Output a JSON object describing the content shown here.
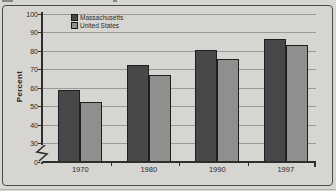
{
  "figure": {
    "background_color": "#d6d5d1",
    "border_color": "#4b4b4b",
    "note": "cropped caption fragments visible at top edge"
  },
  "chart_data": {
    "type": "bar",
    "title": "",
    "xlabel": "",
    "ylabel": "Percent",
    "categories": [
      "1970",
      "1980",
      "1990",
      "1997"
    ],
    "series": [
      {
        "name": "Massachusetts",
        "color": "#48484a",
        "values": [
          58.5,
          72.5,
          80.5,
          86.5
        ]
      },
      {
        "name": "United States",
        "color": "#8f8f8d",
        "values": [
          52.5,
          67,
          75.5,
          83
        ]
      }
    ],
    "y_ticks": [
      0,
      30,
      40,
      50,
      60,
      70,
      80,
      90,
      100
    ],
    "ylim": [
      0,
      100
    ],
    "axis_break_between": [
      0,
      30
    ],
    "grid": true,
    "gridline_color": "#9b9a96",
    "axis_color": "#2e2e2e",
    "legend_position": "top-left-inside",
    "bar_outline_color": "#1f1f1f"
  }
}
